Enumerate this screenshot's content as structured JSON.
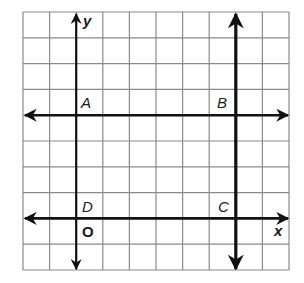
{
  "diagram": {
    "type": "coordinate-grid",
    "grid": {
      "columns": 10,
      "rows": 10,
      "left": 23,
      "top": 12,
      "cell_w": 26.6,
      "cell_h": 25.8,
      "line_color": "#8a8a8a"
    },
    "axes": {
      "x_label": "x",
      "y_label": "y",
      "origin_label": "O",
      "y_axis_column": 2,
      "x_axis_row": 8
    },
    "lines": [
      {
        "name": "line-AB",
        "orientation": "horizontal",
        "row": 4,
        "arrows": "both"
      },
      {
        "name": "line-DC",
        "orientation": "horizontal",
        "row": 8,
        "arrows": "both"
      },
      {
        "name": "line-BC",
        "orientation": "vertical",
        "column": 8,
        "arrows": "both"
      },
      {
        "name": "line-AD",
        "orientation": "vertical",
        "column": 2,
        "arrows": "both"
      }
    ],
    "points": [
      {
        "label": "A",
        "column": 2,
        "row": 4
      },
      {
        "label": "B",
        "column": 8,
        "row": 4
      },
      {
        "label": "C",
        "column": 8,
        "row": 8
      },
      {
        "label": "D",
        "column": 2,
        "row": 8
      }
    ],
    "line_color": "#111111"
  }
}
